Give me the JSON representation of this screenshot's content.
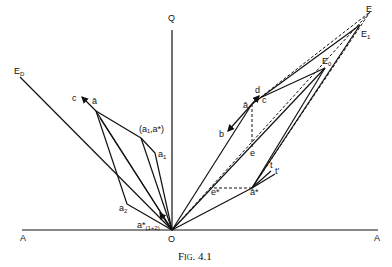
{
  "figure": {
    "caption": "Fig. 4.1",
    "labels": {
      "Q": "Q",
      "O": "O",
      "A_left": "A",
      "A_right": "A",
      "E": "E",
      "E1": "E",
      "E1_sub": "1",
      "E0": "E",
      "E0_sub": "0",
      "ED": "E",
      "ED_sub": "D",
      "c_left": "c",
      "a_bar_left": "ā",
      "a1a_star": "(a₁,a*)",
      "a1": "a",
      "a1_sub": "1",
      "a2": "a",
      "a2_sub": "2",
      "a_star_12": "a*",
      "a_star_12_sub": "(1+2)",
      "d": "d",
      "c_right": "c",
      "a_bar_right": "ā",
      "b": "b",
      "e": "e",
      "e_star": "e*",
      "a_bar_star": "ā*",
      "t": "t",
      "t_prime": "t′"
    }
  }
}
